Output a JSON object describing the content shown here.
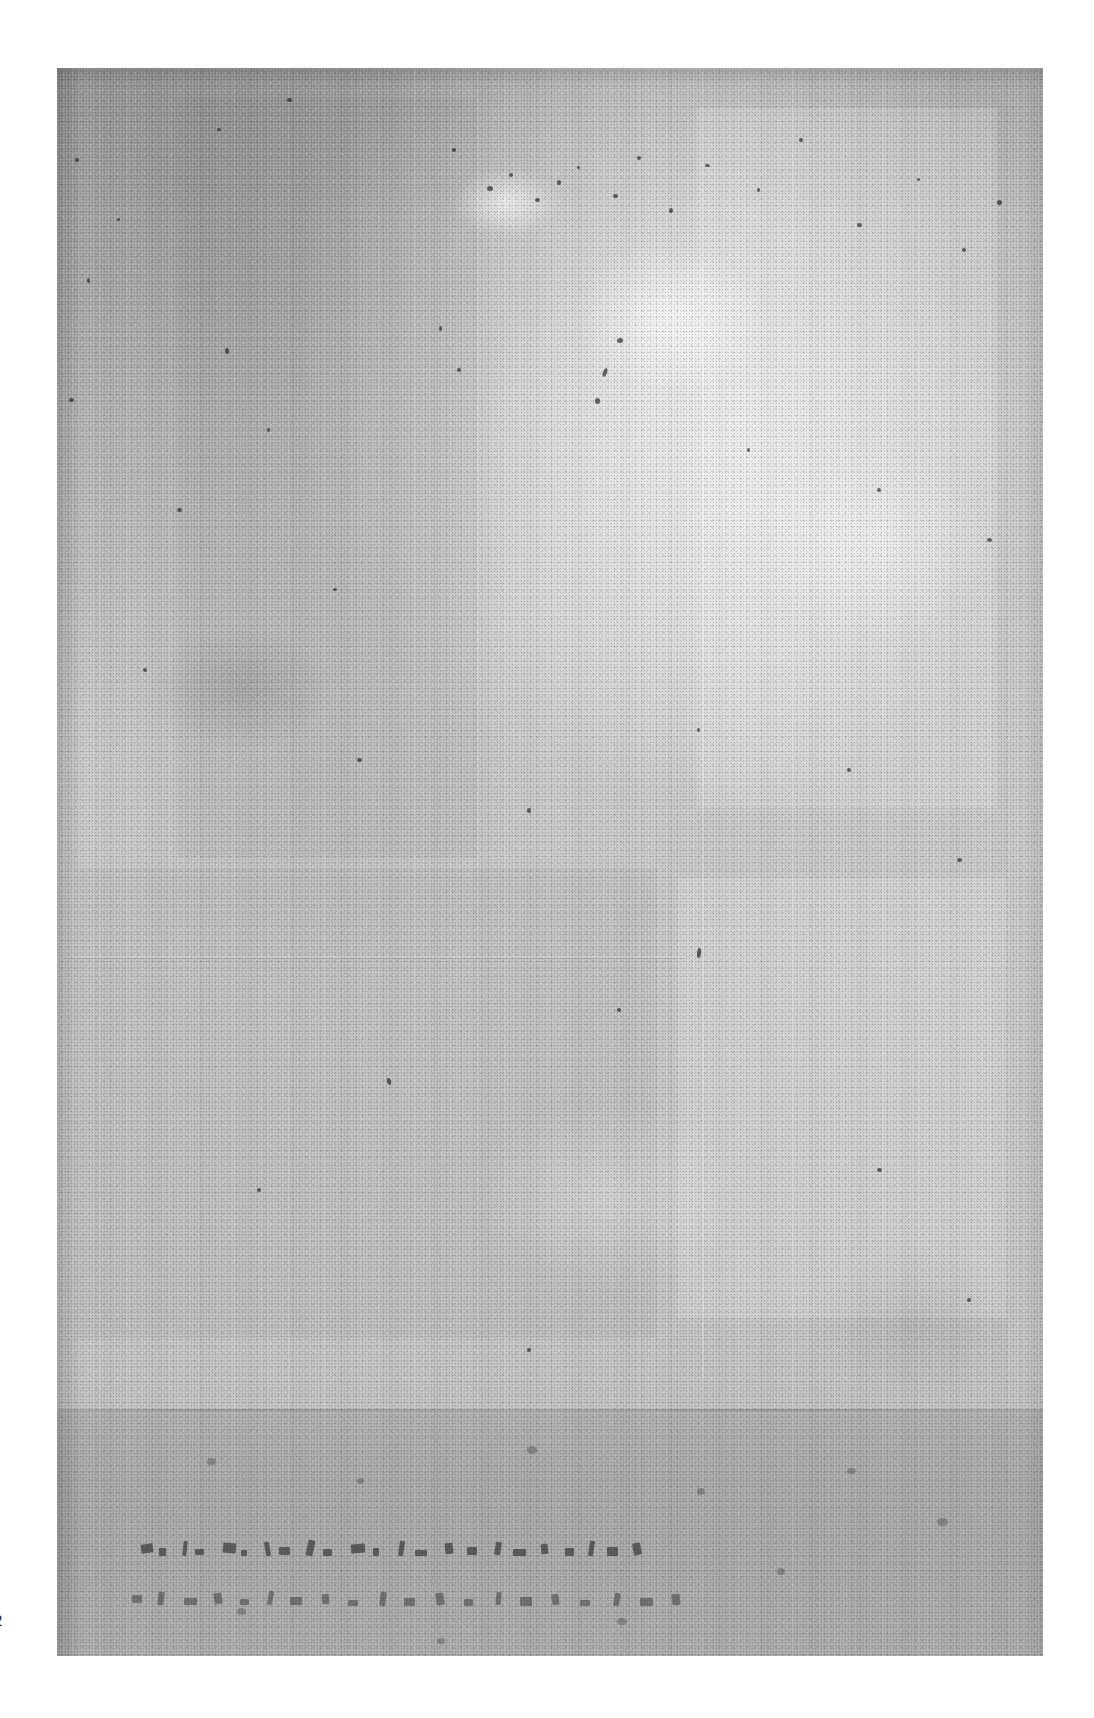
{
  "document": {
    "kind": "scanned-page",
    "condition": "severely degraded, washed out, illegible",
    "caption": "Scanned page of an old document; the page is almost entirely faded to uniform gray paper grain with no legible printed text.",
    "page_number_visible": "2",
    "page_number_note": "partially cropped at the left edge of the image"
  },
  "canvas": {
    "width": 1094,
    "height": 1718,
    "background_color": "#ffffff"
  },
  "sheet": {
    "left": 57,
    "top": 68,
    "width": 986,
    "height": 1588,
    "base_color": "#c3c3c3",
    "top_left_tone": "#999999",
    "mid_tone": "#c8c8c8",
    "bright_blotch_tone": "#d8d8d8",
    "bottom_band_tone": "#b2b2b2"
  },
  "regions": {
    "upper_field_label": "upper page field",
    "lower_field_label": "lower page field",
    "bottom_band_label": "darker bottom band",
    "footer_label": "footer inscription area"
  },
  "footer": {
    "line_1_text": "",
    "line_2_text": "",
    "line_1_note": "row of illegible ink marks",
    "line_2_note": "second row of fainter illegible ink marks"
  },
  "ghost_structures": {
    "horizontal_rule_note": "faint light horizontal rule crossing the sheet",
    "vertical_crease_note": "faint vertical crease / column rule",
    "block_note": "faint rectangular block ghosting through the wash"
  },
  "colors": {
    "paper": "#c3c3c3",
    "paper_dark": "#a3a3a3",
    "paper_light": "#d8d8d8",
    "ink": "#1a1a1a",
    "band": "#b2b2b2",
    "page_background": "#ffffff"
  }
}
